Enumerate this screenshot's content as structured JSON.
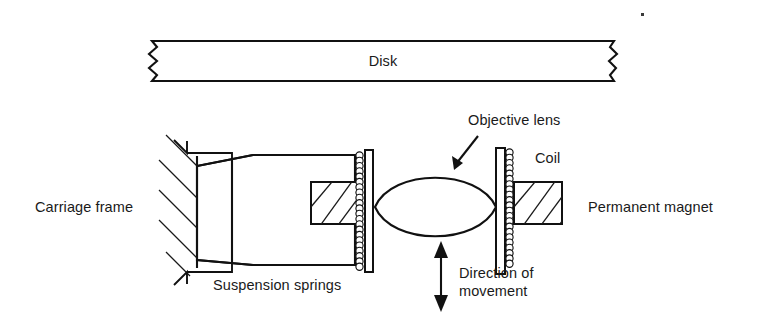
{
  "figure": {
    "background_color": "#ffffff",
    "line_color": "#111111",
    "text_color": "#1a1a1a",
    "width": 770,
    "height": 321
  },
  "labels": {
    "disk": "Disk",
    "carriage_frame": "Carriage frame",
    "suspension_springs": "Suspension springs",
    "objective_lens": "Objective lens",
    "coil": "Coil",
    "permanent_magnet": "Permanent magnet",
    "direction_line1": "Direction of",
    "direction_line2": "movement"
  },
  "components": {
    "disk": {
      "name": "Disk",
      "shape": "horizontal-bar-with-break-marks",
      "break_marks": [
        "left-zigzag",
        "right-zigzag"
      ]
    },
    "carriage_frame": {
      "name": "Carriage frame",
      "shape": "hatched-fixed-wall",
      "hatch_count": 5,
      "hatch_direction": "down-right"
    },
    "suspension_springs": {
      "name": "Suspension springs",
      "count": 2,
      "positions": [
        "top",
        "bottom"
      ],
      "shape": "angled-leaf-spring-bracket"
    },
    "carriage_body": {
      "name": "Carriage body",
      "shape": "tapered-trapezoid"
    },
    "coils": {
      "name": "Coil",
      "count": 2,
      "shape": "vertical-stack-of-circles",
      "beads_per_coil": 22
    },
    "objective_lens": {
      "name": "Objective lens",
      "shape": "biconvex-lens-ellipse"
    },
    "permanent_magnets": {
      "name": "Permanent magnet",
      "count": 2,
      "shape": "hatched-rectangle",
      "hatch_direction": "up-right"
    },
    "direction_arrow": {
      "name": "Direction of movement",
      "shape": "vertical-double-headed-arrow",
      "orientation": "vertical"
    }
  },
  "annotations": {
    "objective_lens_pointer": "diagonal arrow from label down-left to lens",
    "scan_artifact": "small ink dot near top right"
  }
}
